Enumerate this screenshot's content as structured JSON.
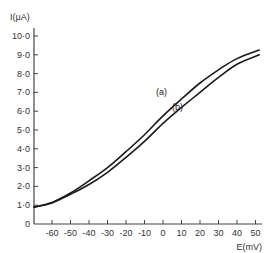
{
  "chart_data": {
    "type": "line",
    "title": "",
    "xlabel": "E(mV)",
    "ylabel": "I(μA)",
    "xlim": [
      -66,
      52
    ],
    "ylim": [
      0,
      10
    ],
    "grid": false,
    "legend": "inline labels",
    "x_ticks": [
      -60,
      -50,
      -40,
      -30,
      -20,
      -10,
      0,
      10,
      20,
      30,
      40,
      50
    ],
    "x_tick_labels": [
      "-60",
      "-50",
      "-40",
      "-30",
      "-20",
      "-10",
      "0",
      "10",
      "20",
      "30",
      "40",
      "50"
    ],
    "y_ticks": [
      0,
      1,
      2,
      3,
      4,
      5,
      6,
      7,
      8,
      9,
      10
    ],
    "y_tick_labels": [
      "0",
      "1·0",
      "2·0",
      "3·0",
      "4·0",
      "5·0",
      "6·0",
      "7·0",
      "8·0",
      "9·0",
      "10·0"
    ],
    "x": [
      -66,
      -60,
      -50,
      -40,
      -30,
      -20,
      -10,
      0,
      10,
      20,
      30,
      40,
      52
    ],
    "series": [
      {
        "name": "(a)",
        "values": [
          0.9,
          1.15,
          1.65,
          2.3,
          3.0,
          3.85,
          4.75,
          5.75,
          6.65,
          7.5,
          8.2,
          8.8,
          9.25
        ]
      },
      {
        "name": "(b)",
        "values": [
          0.9,
          1.12,
          1.58,
          2.1,
          2.75,
          3.55,
          4.4,
          5.35,
          6.2,
          7.0,
          7.8,
          8.5,
          9.0
        ]
      }
    ],
    "annotations": [
      {
        "text": "(a)",
        "x": 0,
        "y": 7.0
      },
      {
        "text": "(b)",
        "x": 8,
        "y": 6.2
      }
    ]
  }
}
